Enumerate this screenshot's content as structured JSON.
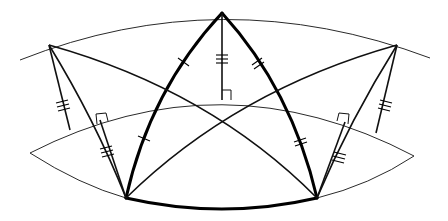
{
  "diagram": {
    "colors": {
      "stroke": "#000000",
      "background": "#ffffff"
    },
    "points": {
      "apex_top": [
        222,
        13
      ],
      "upper_left": [
        49,
        45
      ],
      "upper_right": [
        397,
        45
      ],
      "bottom_left": [
        126,
        198
      ],
      "bottom_right": [
        317,
        198
      ],
      "lower_arc_left_tip": [
        30,
        153
      ],
      "lower_arc_right_tip": [
        414,
        156
      ],
      "top_altitude_foot": [
        222,
        100
      ]
    },
    "arcs": [
      "upper great circle arc",
      "lower lens upper arc",
      "lower lens bottom arc"
    ],
    "tick_marks": {
      "single": [
        "left thick side"
      ],
      "double": [
        "right thick side"
      ],
      "triple": [
        "top altitude",
        "left outer altitude",
        "left inner segment",
        "right outer altitude",
        "right inner segment"
      ]
    },
    "right_angle_markers": 3
  }
}
